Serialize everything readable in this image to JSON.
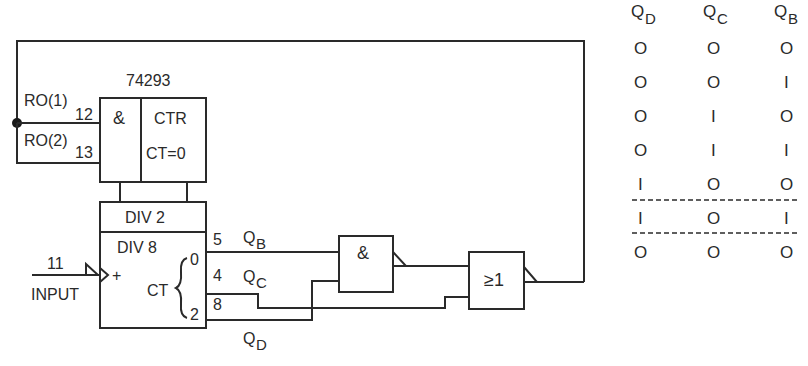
{
  "diagram": {
    "chip_label": "74293",
    "reset_inputs": [
      {
        "label": "RO(1)",
        "pin": "12"
      },
      {
        "label": "RO(2)",
        "pin": "13"
      }
    ],
    "reset_gate": {
      "symbol": "&"
    },
    "counter_block": {
      "title": "CTR",
      "condition": "CT=0"
    },
    "div2_label": "DIV 2",
    "div8_label": "DIV 8",
    "ct_label": "CT",
    "ct_bits": {
      "low": "0",
      "high": "2"
    },
    "input": {
      "pin": "11",
      "label": "INPUT",
      "plus": "+"
    },
    "outputs": [
      {
        "pin": "5",
        "name": "Q",
        "sub": "B"
      },
      {
        "pin": "4",
        "name": "Q",
        "sub": "C"
      },
      {
        "pin": "8",
        "name": "Q",
        "sub": "D"
      }
    ],
    "and_gate": {
      "symbol": "&"
    },
    "or_gate": {
      "symbol": "≥1"
    }
  },
  "truth_table": {
    "headers": [
      {
        "name": "Q",
        "sub": "D"
      },
      {
        "name": "Q",
        "sub": "C"
      },
      {
        "name": "Q",
        "sub": "B"
      }
    ],
    "rows": [
      [
        "O",
        "O",
        "O"
      ],
      [
        "O",
        "O",
        "I"
      ],
      [
        "O",
        "I",
        "O"
      ],
      [
        "O",
        "I",
        "I"
      ],
      [
        "I",
        "O",
        "O"
      ],
      [
        "I",
        "O",
        "I"
      ],
      [
        "O",
        "O",
        "O"
      ]
    ]
  }
}
